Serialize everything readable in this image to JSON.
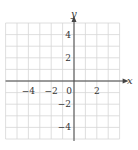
{
  "chart_data": {
    "type": "line",
    "title": "",
    "xlabel": "x",
    "ylabel": "y",
    "xlim": [
      -6,
      4
    ],
    "ylim": [
      -5,
      5
    ],
    "grid": true,
    "x_ticks": [
      -4,
      -2,
      0,
      2
    ],
    "y_ticks": [
      4,
      2,
      -2,
      -4
    ],
    "x_tick_labels": [
      "−4",
      "−2",
      "0",
      "2"
    ],
    "y_tick_labels": [
      "4",
      "2",
      "−2",
      "−4"
    ],
    "series": []
  },
  "axes": {
    "x_label": "x",
    "y_label": "y",
    "origin_label": "0"
  }
}
